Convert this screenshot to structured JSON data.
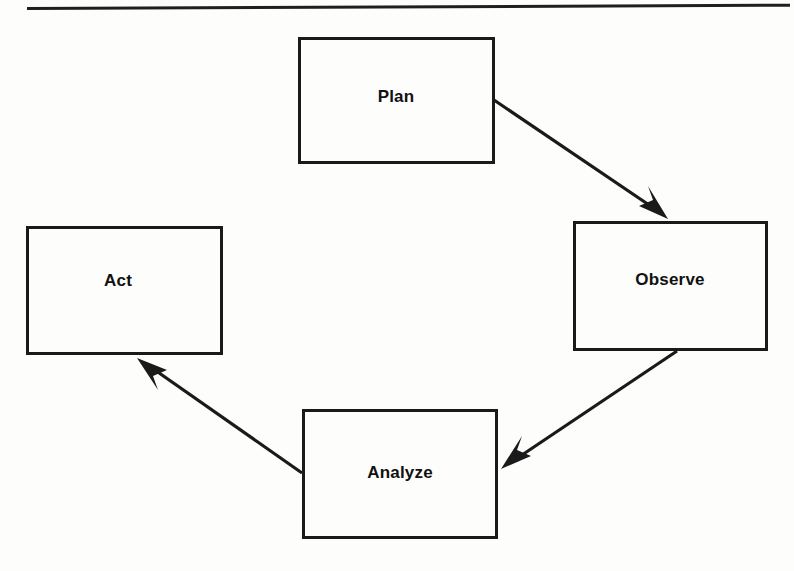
{
  "page": {
    "background_color": "#fdfdfc",
    "ink_color": "#1a1a1a",
    "width": 794,
    "height": 571
  },
  "top_rule": {
    "name": "horizontal-rule",
    "visible": true
  },
  "diagram": {
    "type": "cycle-flowchart",
    "title": "",
    "nodes": [
      {
        "id": "plan",
        "label": "Plan",
        "x": 298,
        "y": 37,
        "width": 197,
        "height": 127,
        "label_x": 396,
        "label_y": 97
      },
      {
        "id": "observe",
        "label": "Observe",
        "x": 573,
        "y": 221,
        "width": 195,
        "height": 130,
        "label_x": 670,
        "label_y": 280
      },
      {
        "id": "analyze",
        "label": "Analyze",
        "x": 302,
        "y": 409,
        "width": 196,
        "height": 130,
        "label_x": 400,
        "label_y": 473
      },
      {
        "id": "act",
        "label": "Act",
        "x": 26,
        "y": 226,
        "width": 197,
        "height": 129,
        "label_x": 118,
        "label_y": 281
      }
    ],
    "edges": [
      {
        "id": "plan-to-observe",
        "from": "plan",
        "to": "observe",
        "label": "",
        "arrowhead": "filled-triangle"
      },
      {
        "id": "observe-to-analyze",
        "from": "observe",
        "to": "analyze",
        "label": "",
        "arrowhead": "filled-triangle"
      },
      {
        "id": "analyze-to-act",
        "from": "analyze",
        "to": "act",
        "label": "",
        "arrowhead": "filled-triangle"
      }
    ]
  }
}
